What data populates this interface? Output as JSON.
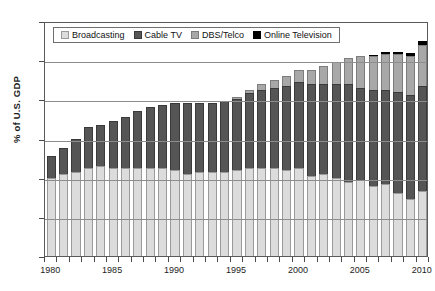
{
  "chart_data": {
    "type": "bar",
    "stacked": true,
    "title": "",
    "subtitle": "",
    "xlabel": "",
    "ylabel": "% of U.S. GDP",
    "ylim": [
      0.0,
      1.2
    ],
    "ytick_values": [
      0.0,
      0.2,
      0.4,
      0.6,
      0.8,
      1.0,
      1.2
    ],
    "ytick_labels": [
      "0.0%",
      "0.2%",
      "0.4%",
      "0.6%",
      "0.8%",
      "1.0%",
      "1.2%"
    ],
    "grid": true,
    "grid_axis": "y",
    "legend_position": "top-inside",
    "categories": [
      "1980",
      "1981",
      "1982",
      "1983",
      "1984",
      "1985",
      "1986",
      "1987",
      "1988",
      "1989",
      "1990",
      "1991",
      "1992",
      "1993",
      "1994",
      "1995",
      "1996",
      "1997",
      "1998",
      "1999",
      "2000",
      "2001",
      "2002",
      "2003",
      "2004",
      "2005",
      "2006",
      "2007",
      "2008",
      "2009",
      "2010"
    ],
    "xtick_labels": [
      "1980",
      "1985",
      "1990",
      "1995",
      "2000",
      "2005",
      "2010"
    ],
    "xtick_categories": [
      "1980",
      "1985",
      "1990",
      "1995",
      "2000",
      "2005",
      "2010"
    ],
    "series": [
      {
        "name": "Broadcasting",
        "color": "#dcdcdc",
        "values": [
          0.4,
          0.42,
          0.43,
          0.45,
          0.46,
          0.45,
          0.45,
          0.45,
          0.45,
          0.45,
          0.44,
          0.42,
          0.43,
          0.43,
          0.43,
          0.44,
          0.45,
          0.45,
          0.45,
          0.44,
          0.45,
          0.41,
          0.42,
          0.4,
          0.38,
          0.39,
          0.36,
          0.37,
          0.32,
          0.29,
          0.33
        ]
      },
      {
        "name": "Cable TV",
        "color": "#555555",
        "values": [
          0.11,
          0.13,
          0.17,
          0.21,
          0.21,
          0.24,
          0.26,
          0.29,
          0.31,
          0.32,
          0.34,
          0.36,
          0.35,
          0.35,
          0.36,
          0.36,
          0.38,
          0.4,
          0.41,
          0.43,
          0.44,
          0.47,
          0.46,
          0.48,
          0.5,
          0.47,
          0.49,
          0.48,
          0.52,
          0.53,
          0.54
        ]
      },
      {
        "name": "DBS/Telco",
        "color": "#a8a8a8",
        "values": [
          0.0,
          0.0,
          0.0,
          0.0,
          0.0,
          0.0,
          0.0,
          0.0,
          0.0,
          0.0,
          0.0,
          0.0,
          0.0,
          0.0,
          0.0,
          0.01,
          0.02,
          0.03,
          0.04,
          0.05,
          0.06,
          0.07,
          0.09,
          0.11,
          0.13,
          0.16,
          0.17,
          0.18,
          0.19,
          0.2,
          0.21
        ]
      },
      {
        "name": "Online Television",
        "color": "#000000",
        "values": [
          0.0,
          0.0,
          0.0,
          0.0,
          0.0,
          0.0,
          0.0,
          0.0,
          0.0,
          0.0,
          0.0,
          0.0,
          0.0,
          0.0,
          0.0,
          0.0,
          0.0,
          0.0,
          0.0,
          0.0,
          0.0,
          0.0,
          0.0,
          0.0,
          0.0,
          0.0,
          0.005,
          0.01,
          0.01,
          0.015,
          0.02
        ]
      }
    ],
    "totals": [
      0.51,
      0.55,
      0.6,
      0.66,
      0.67,
      0.69,
      0.71,
      0.74,
      0.76,
      0.77,
      0.78,
      0.78,
      0.78,
      0.78,
      0.79,
      0.81,
      0.85,
      0.88,
      0.9,
      0.92,
      0.95,
      0.95,
      0.97,
      0.99,
      1.01,
      1.02,
      1.025,
      1.04,
      1.04,
      1.035,
      1.1
    ]
  },
  "legend": {
    "items": [
      {
        "label": "Broadcasting",
        "key": "broadcasting"
      },
      {
        "label": "Cable TV",
        "key": "cable"
      },
      {
        "label": "DBS/Telco",
        "key": "dbs"
      },
      {
        "label": "Online Television",
        "key": "online"
      }
    ]
  }
}
